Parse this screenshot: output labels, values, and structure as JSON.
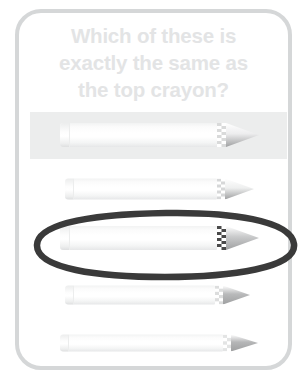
{
  "card": {
    "border_color": "#d5d7d8",
    "background": "#ffffff"
  },
  "prompt": {
    "color": "#e3e4e5",
    "line1": "Which of these is",
    "line2": "exactly the same as",
    "line3": "the top crayon?"
  },
  "highlight": {
    "color": "#eceded",
    "label": "reference-row-highlight"
  },
  "selection": {
    "shape": "ellipse",
    "color": "#3a3a3a",
    "around_option": 3
  },
  "options": [
    {
      "id": "reference-crayon",
      "role": "reference",
      "label": "Top crayon (reference)",
      "selected": false,
      "highlighted": true,
      "left": 41,
      "width": 200,
      "height": 24,
      "cap_width": 10,
      "zigzag_left": 157,
      "zigzag_width": 9,
      "zigzag_color": "#d9dada",
      "tip_width": 34,
      "tip_color": "#ededee"
    },
    {
      "id": "option-crayon-2",
      "role": "choice",
      "label": "Choice 2",
      "selected": false,
      "highlighted": false,
      "left": 46,
      "width": 190,
      "height": 21,
      "cap_width": 9,
      "zigzag_left": 152,
      "zigzag_width": 8,
      "zigzag_color": "#d6d7d8",
      "tip_width": 30,
      "tip_color": "#eeefef"
    },
    {
      "id": "option-crayon-3",
      "role": "choice",
      "label": "Choice 3",
      "selected": true,
      "highlighted": false,
      "left": 41,
      "width": 200,
      "height": 24,
      "cap_width": 10,
      "zigzag_left": 157,
      "zigzag_width": 9,
      "zigzag_color": "#4a4a4a",
      "tip_width": 34,
      "tip_color": "#c9cacb"
    },
    {
      "id": "option-crayon-4",
      "role": "choice",
      "label": "Choice 4",
      "selected": false,
      "highlighted": false,
      "left": 46,
      "width": 186,
      "height": 19,
      "cap_width": 9,
      "zigzag_left": 150,
      "zigzag_width": 8,
      "zigzag_color": "#dcdddd",
      "tip_width": 28,
      "tip_color": "#b9babb"
    },
    {
      "id": "option-crayon-5",
      "role": "choice",
      "label": "Choice 5",
      "selected": false,
      "highlighted": false,
      "left": 41,
      "width": 198,
      "height": 17,
      "cap_width": 9,
      "zigzag_left": 163,
      "zigzag_width": 8,
      "zigzag_color": "#e3e4e4",
      "tip_width": 28,
      "tip_color": "#b5b6b7"
    }
  ]
}
